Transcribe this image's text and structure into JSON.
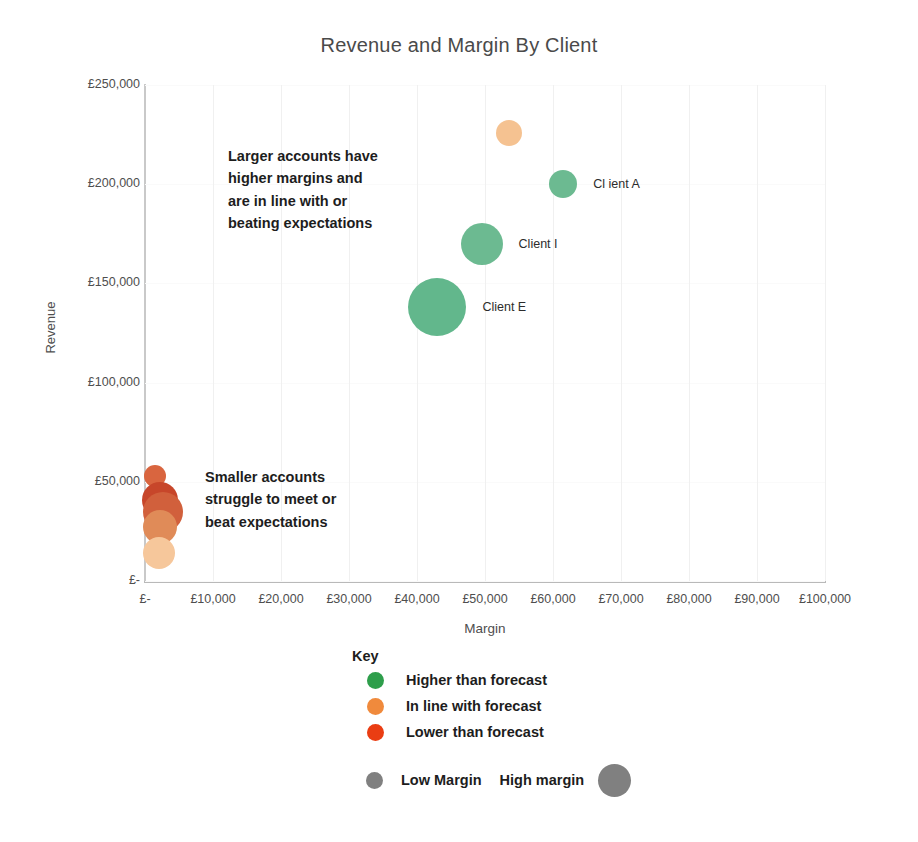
{
  "chart_data": {
    "type": "scatter",
    "title": "Revenue and Margin By Client",
    "xlabel": "Margin",
    "ylabel": "Revenue",
    "xlim": [
      0,
      100000
    ],
    "ylim": [
      0,
      250000
    ],
    "grid": true,
    "legend_position": "below-center",
    "x_ticks": [
      "£-",
      "£10,000",
      "£20,000",
      "£30,000",
      "£40,000",
      "£50,000",
      "£60,000",
      "£70,000",
      "£80,000",
      "£90,000",
      "£100,000"
    ],
    "x_tick_values": [
      0,
      10000,
      20000,
      30000,
      40000,
      50000,
      60000,
      70000,
      80000,
      90000,
      100000
    ],
    "y_ticks": [
      "£-",
      "£50,000",
      "£100,000",
      "£150,000",
      "£200,000",
      "£250,000"
    ],
    "y_tick_values": [
      0,
      50000,
      100000,
      150000,
      200000,
      250000
    ],
    "bubble_size_meaning": "Bubble area scales with account size (margin)",
    "points": [
      {
        "label": "Cl ient A",
        "x": 61500,
        "y": 200000,
        "r": 14,
        "color": "#6cba91",
        "category": "Higher than forecast",
        "show_label": true
      },
      {
        "label": "Client I",
        "x": 49500,
        "y": 170000,
        "r": 21,
        "color": "#6cba91",
        "category": "Higher than forecast",
        "show_label": true
      },
      {
        "label": "Client E",
        "x": 43000,
        "y": 138000,
        "r": 29,
        "color": "#62b78c",
        "category": "Higher than forecast",
        "show_label": true
      },
      {
        "label": "",
        "x": 53500,
        "y": 226000,
        "r": 13,
        "color": "#f5c291",
        "category": "In line with forecast",
        "show_label": false
      },
      {
        "label": "",
        "x": 1500,
        "y": 53000,
        "r": 11,
        "color": "#d9653f",
        "category": "Lower than forecast",
        "show_label": false
      },
      {
        "label": "",
        "x": 2200,
        "y": 41000,
        "r": 18,
        "color": "#c7462a",
        "category": "Lower than forecast",
        "show_label": false
      },
      {
        "label": "",
        "x": 2600,
        "y": 35000,
        "r": 20,
        "color": "#d1603c",
        "category": "Lower than forecast",
        "show_label": false
      },
      {
        "label": "",
        "x": 2200,
        "y": 27000,
        "r": 17,
        "color": "#e08b58",
        "category": "Lower than forecast",
        "show_label": false
      },
      {
        "label": "",
        "x": 2000,
        "y": 14000,
        "r": 16,
        "color": "#f6c79b",
        "category": "In line with forecast",
        "show_label": false
      }
    ],
    "annotations": [
      {
        "id": "upper",
        "lines": [
          "Larger accounts have",
          "higher margins and",
          "are in line with or",
          "beating expectations"
        ],
        "x": 228,
        "y": 145
      },
      {
        "id": "lower",
        "lines": [
          "Smaller accounts",
          "struggle to meet or",
          "beat expectations"
        ],
        "x": 205,
        "y": 466
      }
    ],
    "legend": {
      "title": "Key",
      "categories": [
        {
          "label": "Higher than forecast",
          "color": "#2e9e4b"
        },
        {
          "label": "In line with forecast",
          "color": "#f08a3c"
        },
        {
          "label": "Lower than forecast",
          "color": "#ea3d13"
        }
      ],
      "size_scale": {
        "low_label": "Low Margin",
        "high_label": "High margin",
        "color": "#808080"
      }
    }
  }
}
